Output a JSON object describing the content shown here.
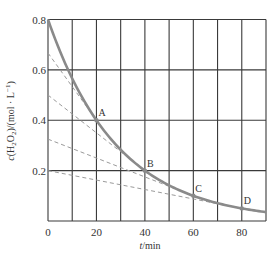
{
  "chart_data": {
    "type": "line",
    "title": "",
    "xlabel": "t/min",
    "ylabel": "c(H2O2)/(mol · L⁻¹)",
    "xlim": [
      0,
      90
    ],
    "ylim": [
      0,
      0.8
    ],
    "grid": true,
    "x_ticks": [
      0,
      20,
      40,
      60,
      80
    ],
    "x_grid_step": 10,
    "y_ticks": [
      0.2,
      0.4,
      0.6,
      0.8
    ],
    "y_tick_labels": [
      "0.2",
      "0.4",
      "0.6",
      "0.8"
    ],
    "x_tick_labels": [
      "0",
      "20",
      "40",
      "60",
      "80"
    ],
    "series": [
      {
        "name": "c(H2O2) decay curve",
        "style": "solid",
        "x": [
          0,
          10,
          20,
          30,
          40,
          50,
          60,
          70,
          80,
          90
        ],
        "values": [
          0.8,
          0.566,
          0.4,
          0.283,
          0.2,
          0.141,
          0.1,
          0.071,
          0.05,
          0.035
        ]
      },
      {
        "name": "tangent at A",
        "style": "dashed",
        "x": [
          0,
          20
        ],
        "values": [
          0.667,
          0.4
        ]
      },
      {
        "name": "tangent at B",
        "style": "dashed",
        "x": [
          0,
          40
        ],
        "values": [
          0.5,
          0.2
        ]
      },
      {
        "name": "tangent at C",
        "style": "dashed",
        "x": [
          0,
          60
        ],
        "values": [
          0.325,
          0.1
        ]
      },
      {
        "name": "tangent at D",
        "style": "dashed",
        "x": [
          0,
          80
        ],
        "values": [
          0.2,
          0.05
        ]
      }
    ],
    "annotations": [
      {
        "label": "A",
        "x": 20,
        "y": 0.4
      },
      {
        "label": "B",
        "x": 40,
        "y": 0.2
      },
      {
        "label": "C",
        "x": 60,
        "y": 0.1
      },
      {
        "label": "D",
        "x": 80,
        "y": 0.05
      }
    ]
  },
  "labels": {
    "xlabel_italic": "t",
    "xlabel_rest": "/min",
    "ylabel_c": "c",
    "ylabel_rest_1": "(H",
    "ylabel_sub1": "2",
    "ylabel_rest_2": "O",
    "ylabel_sub2": "2",
    "ylabel_rest_3": ")/(mol · L",
    "ylabel_sup": "−1",
    "ylabel_rest_4": ")"
  },
  "colors": {
    "grid": "#3a3a3a",
    "curve": "#8a8a8a",
    "tangent": "#9a9a9a",
    "text": "#333333"
  }
}
